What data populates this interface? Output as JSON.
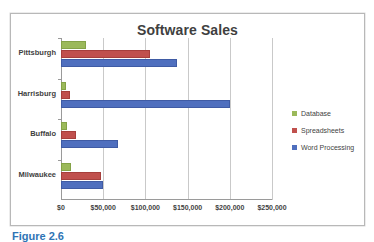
{
  "chart": {
    "title": "Software Sales",
    "frame_border_color": "#b8b8b8",
    "background": "#ffffff"
  },
  "legend": {
    "position": "right",
    "items": [
      {
        "label": "Database",
        "color": "#9bb95a",
        "marker": "square-marker"
      },
      {
        "label": "Spreadsheets",
        "color": "#c0504d",
        "marker": "square-marker"
      },
      {
        "label": "Word Processing",
        "color": "#4f6fbe",
        "marker": "square-marker"
      }
    ]
  },
  "x_axis": {
    "ticks": [
      "$0",
      "$50,000",
      "$100,000",
      "$150,000",
      "$200,000",
      "$250,000"
    ]
  },
  "y_axis": {
    "categories": [
      "Pittsburgh",
      "Harrisburg",
      "Buffalo",
      "Milwaukee"
    ]
  },
  "caption": {
    "text": "Figure 2.6"
  },
  "chart_data": {
    "type": "bar",
    "orientation": "horizontal",
    "title": "Software Sales",
    "xlabel": "",
    "ylabel": "",
    "categories": [
      "Pittsburgh",
      "Harrisburg",
      "Buffalo",
      "Milwaukee"
    ],
    "series": [
      {
        "name": "Database",
        "color": "#9bb95a",
        "values": [
          30000,
          6000,
          7000,
          12000
        ]
      },
      {
        "name": "Spreadsheets",
        "color": "#c0504d",
        "values": [
          105000,
          11000,
          18000,
          47000
        ]
      },
      {
        "name": "Word Processing",
        "color": "#4f6fbe",
        "values": [
          138000,
          200000,
          67000,
          50000
        ]
      }
    ],
    "xlim": [
      0,
      250000
    ],
    "xticks": [
      0,
      50000,
      100000,
      150000,
      200000,
      250000
    ],
    "xtick_labels": [
      "$0",
      "$50,000",
      "$100,000",
      "$150,000",
      "$200,000",
      "$250,000"
    ],
    "grid": "vertical",
    "legend_position": "right"
  }
}
